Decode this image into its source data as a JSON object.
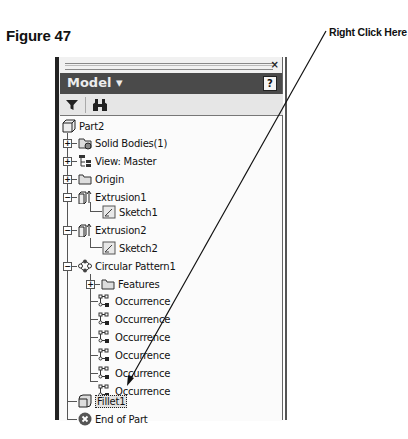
{
  "figure": {
    "label": "Figure 47"
  },
  "callout": {
    "label": "Right Click Here"
  },
  "panel": {
    "close_label": "×",
    "title": "Model ▾",
    "help_label": "?",
    "toolbar": [
      {
        "name": "filter-icon",
        "glyph": "▼"
      },
      {
        "name": "find-icon",
        "glyph": "binoculars"
      }
    ]
  },
  "tree": {
    "root": "Part2",
    "items": [
      {
        "label": "Solid Bodies(1)",
        "icon": "solid-bodies",
        "expander": "+"
      },
      {
        "label": "View: Master",
        "icon": "view",
        "expander": "+"
      },
      {
        "label": "Origin",
        "icon": "folder",
        "expander": "+"
      },
      {
        "label": "Extrusion1",
        "icon": "extrusion",
        "expander": "-"
      },
      {
        "label": "Sketch1",
        "icon": "sketch"
      },
      {
        "label": "Extrusion2",
        "icon": "extrusion",
        "expander": "-"
      },
      {
        "label": "Sketch2",
        "icon": "sketch"
      },
      {
        "label": "Circular Pattern1",
        "icon": "circular-pattern",
        "expander": "-"
      },
      {
        "label": "Features",
        "icon": "folder",
        "expander": "+"
      },
      {
        "label": "Occurrence",
        "icon": "occurrence"
      },
      {
        "label": "Occurrence",
        "icon": "occurrence"
      },
      {
        "label": "Occurrence",
        "icon": "occurrence"
      },
      {
        "label": "Occurrence",
        "icon": "occurrence"
      },
      {
        "label": "Occurrence",
        "icon": "occurrence"
      },
      {
        "label": "Occurrence",
        "icon": "occurrence"
      },
      {
        "label": "Fillet1",
        "icon": "fillet",
        "selected": true
      },
      {
        "label": "End of Part",
        "icon": "end-of-part"
      }
    ]
  }
}
